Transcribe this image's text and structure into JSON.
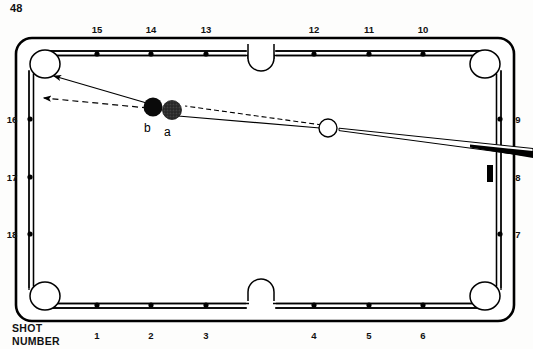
{
  "page": {
    "number": "48"
  },
  "caption": {
    "line1": "SHOT",
    "line2": "NUMBER"
  },
  "table": {
    "felt_color": "#ffffff",
    "line_color": "#000000",
    "outer": {
      "x": 16,
      "y": 38,
      "width": 498,
      "height": 283,
      "corner_radius": 16
    },
    "inner_rail_inset": 14
  },
  "rails": {
    "top_numbers": [
      "15",
      "14",
      "13",
      "12",
      "11",
      "10"
    ],
    "top_positions_x": [
      97,
      151,
      206,
      314,
      369,
      423
    ],
    "top_label_y": 24,
    "bottom_numbers": [
      "1",
      "2",
      "3",
      "4",
      "5",
      "6"
    ],
    "bottom_positions_x": [
      97,
      151,
      206,
      314,
      369,
      423
    ],
    "bottom_label_y": 330,
    "left_numbers": [
      "16",
      "17",
      "18"
    ],
    "left_positions_y": [
      119,
      177,
      234
    ],
    "left_label_x": 8,
    "right_numbers": [
      "9",
      "8",
      "7"
    ],
    "right_positions_y": [
      119,
      177,
      234
    ],
    "right_label_x": 518
  },
  "diamonds": {
    "color": "#000000",
    "radius": 2.6,
    "top_y": 54,
    "bottom_y": 305,
    "left_x": 30,
    "right_x": 500,
    "top_x": [
      97,
      151,
      206,
      314,
      369,
      423
    ],
    "bottom_x": [
      97,
      151,
      206,
      314,
      369,
      423
    ],
    "left_y": [
      119,
      177,
      234
    ],
    "right_y": [
      119,
      177,
      234
    ]
  },
  "pockets": {
    "corners": [
      {
        "name": "top-left",
        "cx": 45,
        "cy": 64
      },
      {
        "name": "top-right",
        "cx": 485,
        "cy": 64
      },
      {
        "name": "bottom-left",
        "cx": 45,
        "cy": 296
      },
      {
        "name": "bottom-right",
        "cx": 485,
        "cy": 296
      }
    ],
    "sides": [
      {
        "name": "top-side",
        "cx": 261,
        "cy": 58
      },
      {
        "name": "bottom-side",
        "cx": 261,
        "cy": 301
      }
    ]
  },
  "balls": [
    {
      "label": "b",
      "cx": 153,
      "cy": 107,
      "r": 9.5,
      "fill": "#0a0a0a",
      "type": "object-ball-solid",
      "label_x": 144,
      "label_y": 131
    },
    {
      "label": "a",
      "cx": 172,
      "cy": 110,
      "r": 9.5,
      "fill": "#2f2f2f",
      "type": "object-ball-textured",
      "label_x": 164,
      "label_y": 134
    },
    {
      "label": "",
      "cx": 328,
      "cy": 128,
      "r": 9.0,
      "fill": "#ffffff",
      "type": "cue-ball",
      "label_x": 0,
      "label_y": 0
    }
  ],
  "shot_lines": {
    "solid_to_pocket": {
      "x1": 150,
      "y1": 104,
      "x2": 51,
      "y2": 76,
      "style": "solid",
      "arrow": true
    },
    "dashed_to_pocket": {
      "x1": 150,
      "y1": 107,
      "x2": 40,
      "y2": 97,
      "style": "dashed",
      "arrow": true
    },
    "cue_solid": {
      "x1": 318,
      "y1": 126,
      "x2": 176,
      "y2": 114,
      "style": "solid",
      "arrow": false
    },
    "cue_dashed": {
      "x1": 320,
      "y1": 124,
      "x2": 183,
      "y2": 106,
      "style": "dashed",
      "arrow": false
    }
  },
  "cue_stick": {
    "tip_x": 339,
    "tip_y": 129,
    "butt_x": 533,
    "butt_y": 152,
    "thickness_tip": 1.8,
    "thickness_butt": 5.5,
    "color": "#000000"
  },
  "rail_mark": {
    "name": "aim-mark",
    "x": 487,
    "y": 165,
    "width": 6,
    "height": 17,
    "color": "#000000"
  }
}
